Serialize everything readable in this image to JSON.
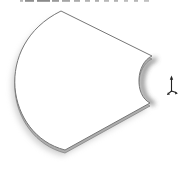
{
  "window": {
    "width": 190,
    "height": 169,
    "background_color": "#ffffff"
  },
  "viewport": {
    "name": "cad-graphics-area",
    "part": {
      "label": "curved-sector-plate",
      "face_color": "#ffffff",
      "edge_color": "#767676",
      "side_color": "#aeaeae",
      "shadow_color": "#999999",
      "notch_shadow_color": "#4f4f4f"
    },
    "origin_triad": {
      "icon": "origin-triad-icon",
      "color": "#222222"
    },
    "top_edge_artifact": {
      "icon": "cropped-text-dashes",
      "y": 0,
      "height": 1.8,
      "dashes": [
        {
          "x": 20,
          "w": 3,
          "color": "#b5b5b5"
        },
        {
          "x": 25,
          "w": 9,
          "color": "#8e8e8e"
        },
        {
          "x": 37,
          "w": 13,
          "color": "#8a8a8a"
        },
        {
          "x": 52,
          "w": 7,
          "color": "#9a9a9a"
        },
        {
          "x": 62,
          "w": 8,
          "color": "#a5a5a5"
        },
        {
          "x": 74,
          "w": 6,
          "color": "#ababab"
        },
        {
          "x": 85,
          "w": 5,
          "color": "#b2b2b2"
        },
        {
          "x": 95,
          "w": 4,
          "color": "#adadad"
        },
        {
          "x": 104,
          "w": 5,
          "color": "#b8b8b8"
        },
        {
          "x": 114,
          "w": 4,
          "color": "#b2b2b2"
        },
        {
          "x": 124,
          "w": 4,
          "color": "#bcbcbc"
        },
        {
          "x": 134,
          "w": 4,
          "color": "#b6b6b6"
        },
        {
          "x": 144,
          "w": 5,
          "color": "#c0c0c0"
        }
      ]
    }
  }
}
